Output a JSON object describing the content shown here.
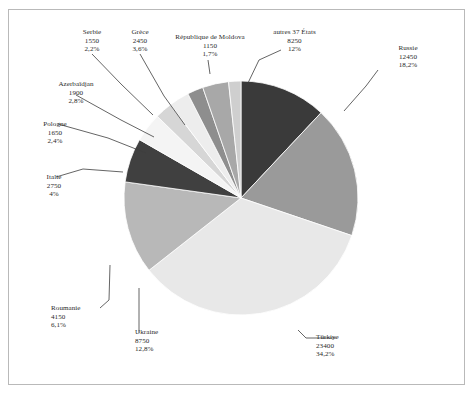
{
  "chart_data": {
    "type": "pie",
    "title": "",
    "xlabel": "",
    "ylabel": "",
    "legend_position": "callout-labels",
    "grid": false,
    "total": 68450,
    "start_angle_deg": 0,
    "direction": "clockwise",
    "categories": [
      "autres 37 États",
      "Russie",
      "Türkiye",
      "Ukraine",
      "Roumanie",
      "Italie",
      "Pologne",
      "Azerbaïdjan",
      "Serbie",
      "Grèce",
      "République de Moldova"
    ],
    "values": [
      8250,
      12450,
      23400,
      8750,
      4150,
      2750,
      1650,
      1900,
      1550,
      2450,
      1150
    ],
    "percents": [
      "12%",
      "18,2%",
      "34,2%",
      "12,8%",
      "6,1%",
      "4%",
      "2,4%",
      "2,8%",
      "2,2%",
      "3,6%",
      "1,7%"
    ],
    "percent_numbers": [
      12.0,
      18.2,
      34.2,
      12.8,
      6.1,
      4.0,
      2.4,
      2.8,
      2.2,
      3.6,
      1.7
    ],
    "colors": [
      "#3a3a3a",
      "#9a9a9a",
      "#e8e8e8",
      "#b8b8b8",
      "#404040",
      "#f4f4f4",
      "#d6d6d6",
      "#ededed",
      "#8e8e8e",
      "#a8a8a8",
      "#cfcfcf"
    ],
    "slices": [
      {
        "label": "autres 37 États",
        "value": 8250,
        "percent": "12%",
        "percent_number": 12.0,
        "color": "#3a3a3a"
      },
      {
        "label": "Russie",
        "value": 12450,
        "percent": "18,2%",
        "percent_number": 18.2,
        "color": "#9a9a9a"
      },
      {
        "label": "Türkiye",
        "value": 23400,
        "percent": "34,2%",
        "percent_number": 34.2,
        "color": "#e8e8e8"
      },
      {
        "label": "Ukraine",
        "value": 8750,
        "percent": "12,8%",
        "percent_number": 12.8,
        "color": "#b8b8b8"
      },
      {
        "label": "Roumanie",
        "value": 4150,
        "percent": "6,1%",
        "percent_number": 6.1,
        "color": "#404040"
      },
      {
        "label": "Italie",
        "value": 2750,
        "percent": "4%",
        "percent_number": 4.0,
        "color": "#f4f4f4"
      },
      {
        "label": "Pologne",
        "value": 1650,
        "percent": "2,4%",
        "percent_number": 2.4,
        "color": "#d6d6d6"
      },
      {
        "label": "Azerbaïdjan",
        "value": 1900,
        "percent": "2,8%",
        "percent_number": 2.8,
        "color": "#ededed"
      },
      {
        "label": "Serbie",
        "value": 1550,
        "percent": "2,2%",
        "percent_number": 2.2,
        "color": "#8e8e8e"
      },
      {
        "label": "Grèce",
        "value": 2450,
        "percent": "3,6%",
        "percent_number": 3.6,
        "color": "#a8a8a8"
      },
      {
        "label": "République de Moldova",
        "value": 1150,
        "percent": "1,7%",
        "percent_number": 1.7,
        "color": "#cfcfcf"
      }
    ]
  },
  "labels": {
    "serbie": {
      "name": "Serbie",
      "value": "1550",
      "percent": "2,2%"
    },
    "grece": {
      "name": "Grèce",
      "value": "2450",
      "percent": "3,6%"
    },
    "moldova": {
      "name": "République de Moldova",
      "value": "1150",
      "percent": "1,7%"
    },
    "autres": {
      "name": "autres 37 États",
      "value": "8250",
      "percent": "12%"
    },
    "russie": {
      "name": "Russie",
      "value": "12450",
      "percent": "18,2%"
    },
    "azerbaidjan": {
      "name": "Azerbaïdjan",
      "value": "1900",
      "percent": "2,8%"
    },
    "pologne": {
      "name": "Pologne",
      "value": "1650",
      "percent": "2,4%"
    },
    "italie": {
      "name": "Italie",
      "value": "2750",
      "percent": "4%"
    },
    "roumanie": {
      "name": "Roumanie",
      "value": "4150",
      "percent": "6,1%"
    },
    "ukraine": {
      "name": "Ukraine",
      "value": "8750",
      "percent": "12,8%"
    },
    "turkiye": {
      "name": "Türkiye",
      "value": "23400",
      "percent": "34,2%"
    }
  },
  "style": {
    "frame_border_color": "#b9b9b9",
    "text_color": "#2b2b2b",
    "leader_line_color": "#3d3d3d",
    "slice_edge_color": "#ffffff"
  }
}
